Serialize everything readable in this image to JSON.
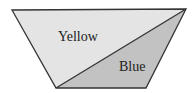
{
  "diagram": {
    "shape": "trapezoid",
    "regions": [
      {
        "name": "yellow-region",
        "label": "Yellow",
        "fill": "#e4e4e4"
      },
      {
        "name": "blue-region",
        "label": "Blue",
        "fill": "#c2c2c2"
      }
    ],
    "stroke": "#333333"
  }
}
